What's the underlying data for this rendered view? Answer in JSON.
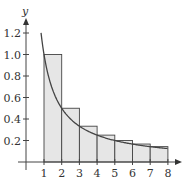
{
  "chart_data": {
    "type": "bar",
    "title": "",
    "xlabel": "",
    "ylabel": "y",
    "xlim": [
      0,
      8.5
    ],
    "ylim": [
      0,
      1.3
    ],
    "grid": false,
    "legend": null,
    "x_ticks": [
      "1",
      "2",
      "3",
      "4",
      "5",
      "6",
      "7",
      "8"
    ],
    "y_ticks": [
      "0.2",
      "0.4",
      "0.6",
      "0.8",
      "1.0",
      "1.2"
    ],
    "bars": {
      "description": "Left-endpoint rectangles under y = 1/x on [1, 8]",
      "left_edges": [
        1,
        2,
        3,
        4,
        5,
        6,
        7
      ],
      "width": 1,
      "values": [
        1.0,
        0.5,
        0.333,
        0.25,
        0.2,
        0.167,
        0.143
      ],
      "fill": "#e6e6e6",
      "stroke": "#444444"
    },
    "series": [
      {
        "name": "y = 1/x",
        "type": "line",
        "x": [
          0.833,
          1,
          1.5,
          2,
          2.5,
          3,
          4,
          5,
          6,
          7,
          8
        ],
        "values": [
          1.2,
          1.0,
          0.667,
          0.5,
          0.4,
          0.333,
          0.25,
          0.2,
          0.167,
          0.143,
          0.125
        ],
        "color": "#444444"
      }
    ]
  },
  "labels": {
    "y_axis": "y",
    "x_ticks": [
      "1",
      "2",
      "3",
      "4",
      "5",
      "6",
      "7",
      "8"
    ],
    "y_ticks": [
      "0.2",
      "0.4",
      "0.6",
      "0.8",
      "1.0",
      "1.2"
    ]
  }
}
